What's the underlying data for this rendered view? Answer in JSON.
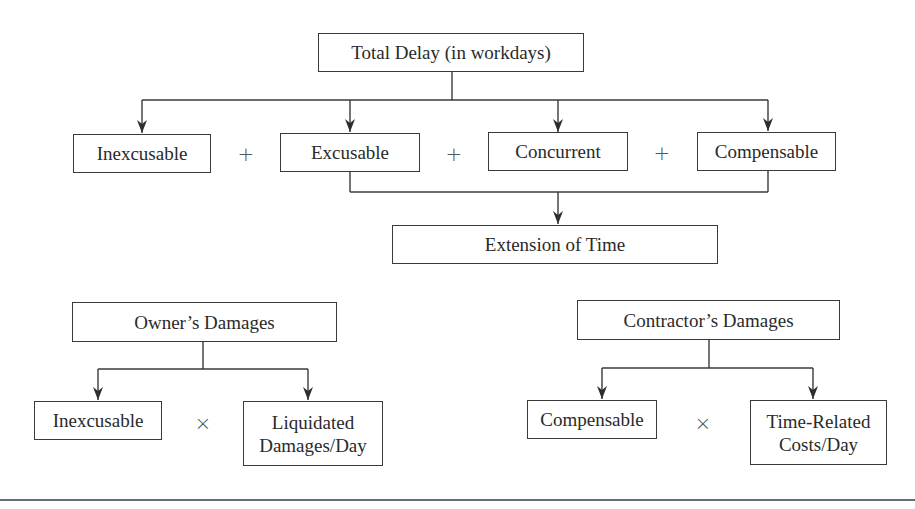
{
  "diagram": {
    "top": {
      "total_delay": "Total Delay (in workdays)",
      "components": [
        {
          "label": "Inexcusable"
        },
        {
          "label": "Excusable"
        },
        {
          "label": "Concurrent"
        },
        {
          "label": "Compensable"
        }
      ],
      "operators": [
        "+",
        "+",
        "+"
      ],
      "extension": "Extension of Time"
    },
    "owner": {
      "title": "Owner’s Damages",
      "left": "Inexcusable",
      "operator": "×",
      "right_line1": "Liquidated",
      "right_line2": "Damages/Day"
    },
    "contractor": {
      "title": "Contractor’s Damages",
      "left": "Compensable",
      "operator": "×",
      "right_line1": "Time-Related",
      "right_line2": "Costs/Day"
    }
  },
  "colors": {
    "line": "#3a3a3a",
    "text": "#2a2a2a",
    "background": "#ffffff"
  }
}
